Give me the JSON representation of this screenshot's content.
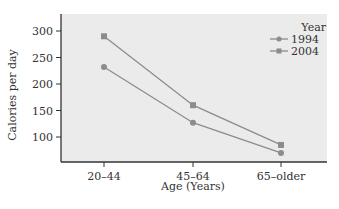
{
  "chart_data": {
    "type": "line",
    "title": "",
    "xlabel": "Age (Years)",
    "ylabel": "Calories per day",
    "categories": [
      "20–44",
      "45–64",
      "65–older"
    ],
    "series": [
      {
        "name": "1994",
        "marker": "circle",
        "values": [
          232,
          127,
          70
        ]
      },
      {
        "name": "2004",
        "marker": "square",
        "values": [
          290,
          160,
          85
        ]
      }
    ],
    "yticks": [
      100,
      150,
      200,
      250,
      300
    ],
    "ylim": [
      50,
      320
    ],
    "grid": false,
    "legend": {
      "title": "Year",
      "position": "top-right",
      "entries": [
        "1994",
        "2004"
      ]
    },
    "colors": {
      "background": "#ebebeb",
      "series": "#8c8c8c",
      "axis": "#333333"
    }
  }
}
